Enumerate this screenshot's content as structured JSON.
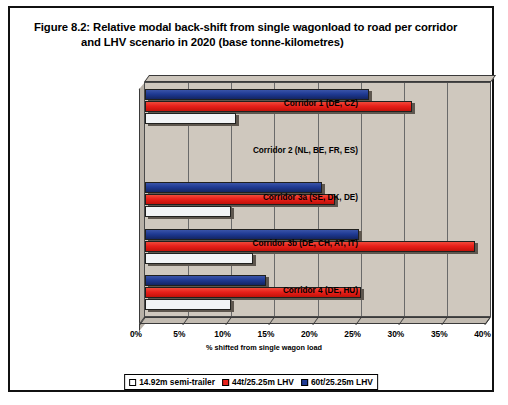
{
  "figure": {
    "label": "Figure 8.2:",
    "title_line1": "Relative modal back-shift from single wagonload to road per corridor",
    "title_line2": "and LHV scenario in 2020 (base tonne-kilometres)"
  },
  "legend": {
    "position": "bottom-center",
    "items": [
      {
        "label": "14.92m semi-trailer",
        "color": "#ffffff"
      },
      {
        "label": "44t/25.25m LHV",
        "color": "#e8201a"
      },
      {
        "label": "60t/25.25m LHV",
        "color": "#1f3a93"
      }
    ]
  },
  "chart_data": {
    "type": "bar",
    "orientation": "horizontal",
    "title": "Relative modal back-shift from single wagonload to road per corridor and LHV scenario in 2020 (base tonne-kilometres)",
    "xlabel": "% shifted from single wagon load",
    "ylabel": "",
    "xlim": [
      0,
      40
    ],
    "xticks": [
      0,
      5,
      10,
      15,
      20,
      25,
      30,
      35,
      40
    ],
    "xticklabels": [
      "0%",
      "5%",
      "10%",
      "15%",
      "20%",
      "25%",
      "30%",
      "35%",
      "40%"
    ],
    "grid": true,
    "categories": [
      "Corridor 1 (DE, CZ)",
      "Corridor 2 (NL, BE, FR, ES)",
      "Corridor 3a (SE, DK, DE)",
      "Corridor 3b (DE, CH, AT, IT)",
      "Corridor 4 (DE, HU)"
    ],
    "series": [
      {
        "name": "14.92m semi-trailer",
        "color": "#ffffff",
        "values": [
          10.5,
          0,
          10.0,
          12.5,
          10.0
        ]
      },
      {
        "name": "44t/25.25m LHV",
        "color": "#e8201a",
        "values": [
          31.0,
          0,
          22.0,
          38.3,
          25.0
        ]
      },
      {
        "name": "60t/25.25m LHV",
        "color": "#1f3a93",
        "values": [
          26.0,
          0,
          20.5,
          24.8,
          14.0
        ]
      }
    ]
  }
}
